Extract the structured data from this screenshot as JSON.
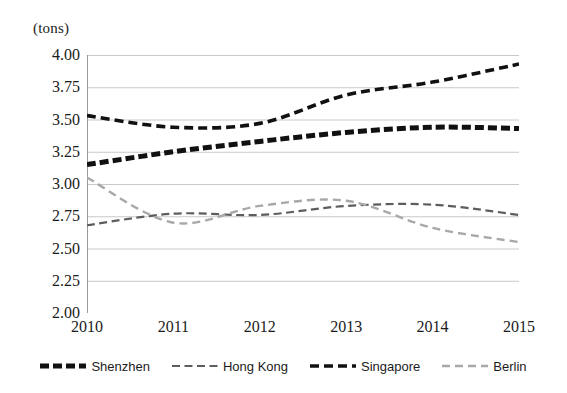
{
  "chart_data": {
    "type": "line",
    "title": "",
    "subtitle": "",
    "unit_label": "(tons)",
    "xlabel": "",
    "ylabel": "",
    "x": [
      2010,
      2011,
      2012,
      2013,
      2014,
      2015
    ],
    "xtick_labels": [
      "2010",
      "2011",
      "2012",
      "2013",
      "2014",
      "2015"
    ],
    "xlim": [
      2010,
      2015
    ],
    "ylim": [
      2.0,
      4.0
    ],
    "ytick_labels": [
      "4.00",
      "3.75",
      "3.50",
      "3.25",
      "3.00",
      "2.75",
      "2.50",
      "2.25",
      "2.00"
    ],
    "yticks": [
      4.0,
      3.75,
      3.5,
      3.25,
      3.0,
      2.75,
      2.5,
      2.25,
      2.0
    ],
    "grid": true,
    "legend_position": "bottom",
    "series": [
      {
        "name": "Shenzhen",
        "color": "#111111",
        "style": "thick-dashed",
        "values": [
          3.15,
          3.25,
          3.33,
          3.4,
          3.44,
          3.43
        ]
      },
      {
        "name": "Hong Kong",
        "color": "#5d5d5d",
        "style": "thin-dashed",
        "values": [
          2.68,
          2.77,
          2.76,
          2.83,
          2.84,
          2.76
        ]
      },
      {
        "name": "Singapore",
        "color": "#111111",
        "style": "medium-dashed",
        "values": [
          3.53,
          3.44,
          3.47,
          3.69,
          3.79,
          3.93
        ]
      },
      {
        "name": "Berlin",
        "color": "#a8a8a8",
        "style": "light-dashed",
        "values": [
          3.05,
          2.7,
          2.83,
          2.87,
          2.66,
          2.55
        ]
      }
    ]
  },
  "axis": {
    "unit_label": "(tons)"
  },
  "legend": {
    "items": [
      {
        "label": "Shenzhen"
      },
      {
        "label": "Hong Kong"
      },
      {
        "label": "Singapore"
      },
      {
        "label": "Berlin"
      }
    ]
  }
}
